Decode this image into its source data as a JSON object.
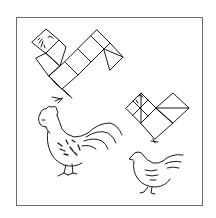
{
  "figure": {
    "elements": [
      {
        "name": "large-tangram-bird",
        "kind": "tangram-puzzle"
      },
      {
        "name": "small-tangram-bird",
        "kind": "tangram-puzzle"
      },
      {
        "name": "rooster-drawing",
        "kind": "illustration"
      },
      {
        "name": "hen-drawing",
        "kind": "illustration"
      }
    ],
    "colors": {
      "line": "#1a1a1a",
      "frame": "#6b6b6b",
      "background": "#ffffff"
    }
  }
}
